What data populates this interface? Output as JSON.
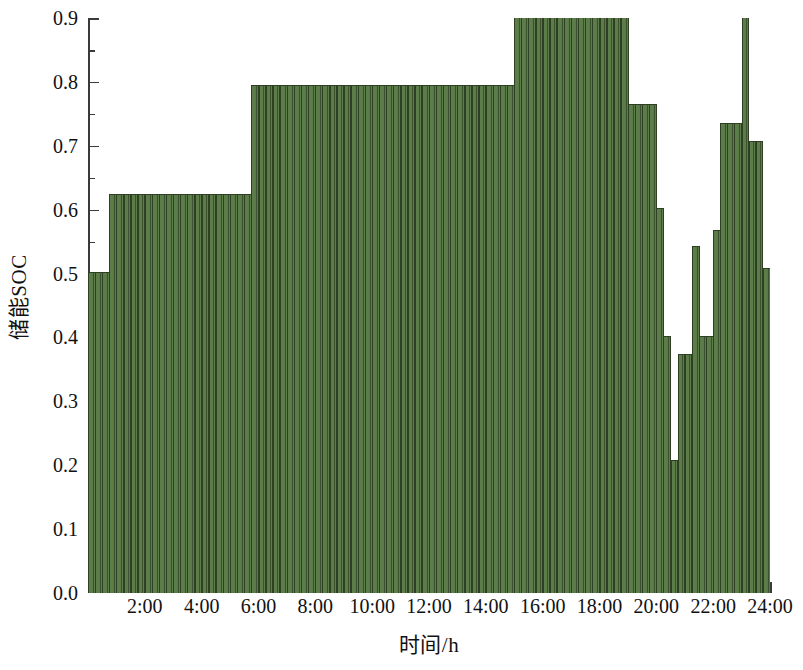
{
  "chart_data": {
    "type": "bar",
    "title": "",
    "xlabel": "时间/h",
    "ylabel": "储能SOC",
    "xlim": [
      0,
      24
    ],
    "ylim": [
      0.0,
      0.9
    ],
    "grid": false,
    "legend": null,
    "series_color": "#5c7d49",
    "edge_color": "#2e3f24",
    "bar_interval_hours": 0.25,
    "y_major_step": 0.1,
    "y_minor_step": 0.05,
    "x_major_step": 2,
    "x_minor_step": 1,
    "ytick_labels": [
      "0.0",
      "0.1",
      "0.2",
      "0.3",
      "0.4",
      "0.5",
      "0.6",
      "0.7",
      "0.8",
      "0.9"
    ],
    "ytick_values": [
      0.0,
      0.1,
      0.2,
      0.3,
      0.4,
      0.5,
      0.6,
      0.7,
      0.8,
      0.9
    ],
    "xtick_labels": [
      "2:00",
      "4:00",
      "6:00",
      "8:00",
      "10:00",
      "12:00",
      "14:00",
      "16:00",
      "18:00",
      "20:00",
      "22:00",
      "24:00"
    ],
    "xtick_values": [
      2,
      4,
      6,
      8,
      10,
      12,
      14,
      16,
      18,
      20,
      22,
      24
    ],
    "x": [
      0.25,
      0.5,
      0.75,
      1.0,
      1.25,
      1.5,
      1.75,
      2.0,
      2.25,
      2.5,
      2.75,
      3.0,
      3.25,
      3.5,
      3.75,
      4.0,
      4.25,
      4.5,
      4.75,
      5.0,
      5.25,
      5.5,
      5.75,
      6.0,
      6.25,
      6.5,
      6.75,
      7.0,
      7.25,
      7.5,
      7.75,
      8.0,
      8.25,
      8.5,
      8.75,
      9.0,
      9.25,
      9.5,
      9.75,
      10.0,
      10.25,
      10.5,
      10.75,
      11.0,
      11.25,
      11.5,
      11.75,
      12.0,
      12.25,
      12.5,
      12.75,
      13.0,
      13.25,
      13.5,
      13.75,
      14.0,
      14.25,
      14.5,
      14.75,
      15.0,
      15.25,
      15.5,
      15.75,
      16.0,
      16.25,
      16.5,
      16.75,
      17.0,
      17.25,
      17.5,
      17.75,
      18.0,
      18.25,
      18.5,
      18.75,
      19.0,
      19.25,
      19.5,
      19.75,
      20.0,
      20.25,
      20.5,
      20.75,
      21.0,
      21.25,
      21.5,
      21.75,
      22.0,
      22.25,
      22.5,
      22.75,
      23.0,
      23.25,
      23.5,
      23.75,
      24.0
    ],
    "values": [
      0.503,
      0.503,
      0.503,
      0.625,
      0.625,
      0.625,
      0.625,
      0.625,
      0.625,
      0.625,
      0.625,
      0.625,
      0.625,
      0.625,
      0.625,
      0.625,
      0.625,
      0.625,
      0.625,
      0.625,
      0.625,
      0.625,
      0.625,
      0.795,
      0.795,
      0.795,
      0.795,
      0.795,
      0.795,
      0.795,
      0.795,
      0.795,
      0.795,
      0.795,
      0.795,
      0.795,
      0.795,
      0.795,
      0.795,
      0.795,
      0.795,
      0.795,
      0.795,
      0.795,
      0.795,
      0.795,
      0.795,
      0.795,
      0.795,
      0.795,
      0.795,
      0.795,
      0.795,
      0.795,
      0.795,
      0.795,
      0.795,
      0.795,
      0.795,
      0.795,
      0.903,
      0.903,
      0.903,
      0.903,
      0.903,
      0.903,
      0.903,
      0.903,
      0.903,
      0.903,
      0.903,
      0.903,
      0.903,
      0.903,
      0.903,
      0.903,
      0.765,
      0.765,
      0.765,
      0.765,
      0.602,
      0.403,
      0.208,
      0.374,
      0.374,
      0.543,
      0.403,
      0.403,
      0.568,
      0.735,
      0.735,
      0.735,
      0.903,
      0.707,
      0.707,
      0.508
    ]
  }
}
